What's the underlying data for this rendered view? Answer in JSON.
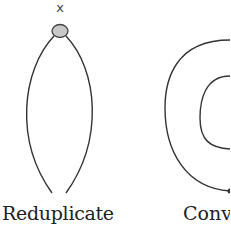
{
  "diagram": {
    "node": {
      "label": "x",
      "fill": "#c8c8c8",
      "stroke": "#444444"
    },
    "panels": [
      {
        "caption": "Reduplicate",
        "shape": "two curved strands joined at top node"
      },
      {
        "caption": "Conv",
        "shape": "nested spiral (truncated at right edge)"
      }
    ],
    "line_color": "#333333"
  }
}
